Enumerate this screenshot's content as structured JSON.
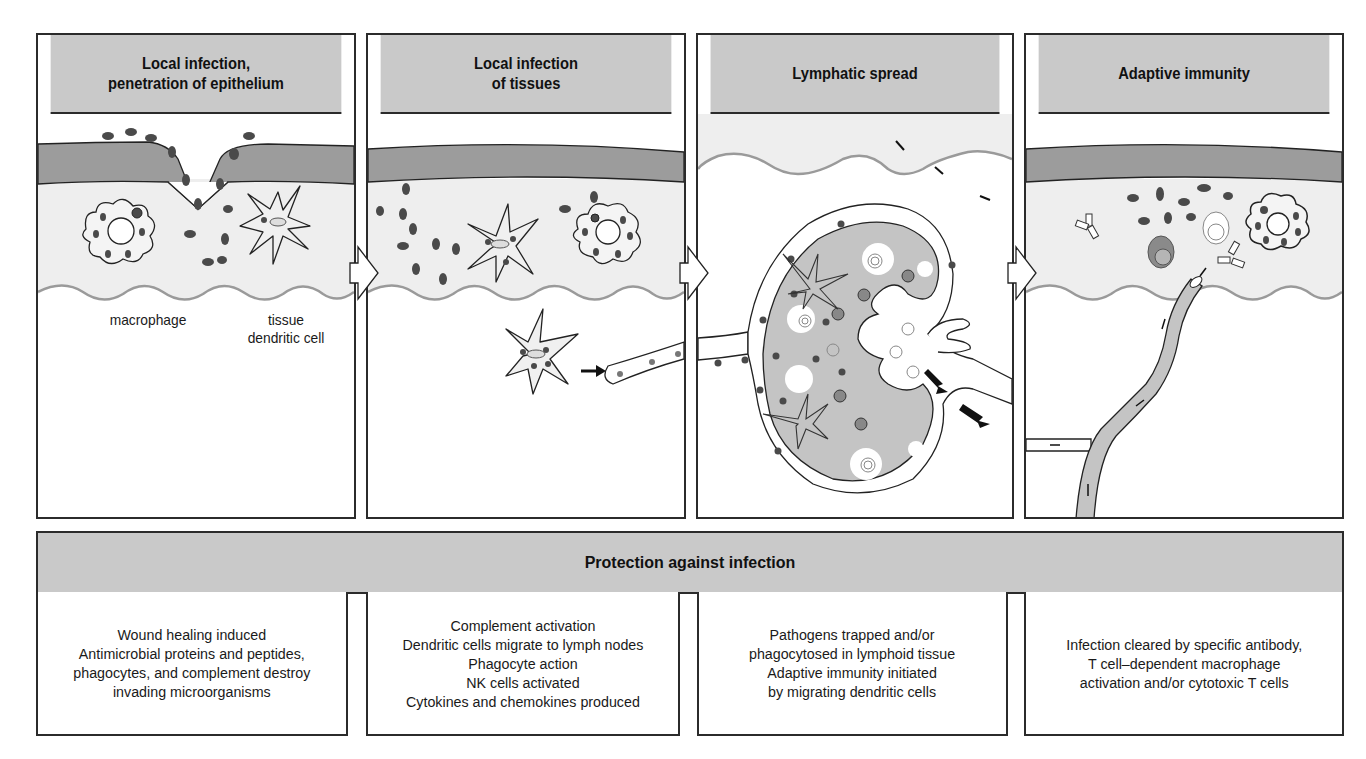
{
  "stages": [
    {
      "title": "Local infection,\npenetration of epithelium",
      "labels": {
        "macrophage": "macrophage",
        "dendritic": "tissue\ndendritic cell"
      }
    },
    {
      "title": "Local infection\nof tissues"
    },
    {
      "title": "Lymphatic spread"
    },
    {
      "title": "Adaptive immunity"
    }
  ],
  "banner": {
    "title": "Protection against infection"
  },
  "outcomes": [
    {
      "lines": [
        "Wound healing induced",
        "Antimicrobial proteins and peptides,",
        "phagocytes, and complement destroy",
        "invading microorganisms"
      ]
    },
    {
      "lines": [
        "Complement activation",
        "Dendritic cells migrate to lymph nodes",
        "Phagocyte action",
        "NK cells activated",
        "Cytokines and chemokines produced"
      ]
    },
    {
      "lines": [
        "Pathogens trapped and/or",
        "phagocytosed in lymphoid tissue",
        "Adaptive immunity initiated",
        "by migrating dendritic cells"
      ]
    },
    {
      "lines": [
        "Infection cleared by specific antibody,",
        "T cell–dependent macrophage",
        "activation and/or cytotoxic T cells"
      ]
    }
  ],
  "colors": {
    "header_fill": "#c9c9c9",
    "epithelium": "#9c9c9c",
    "tissue": "#eeeeee",
    "lymph_node": "#c4c4c4",
    "pathogen": "#4a4a4a",
    "basement_wave": "#9a9a9a"
  }
}
